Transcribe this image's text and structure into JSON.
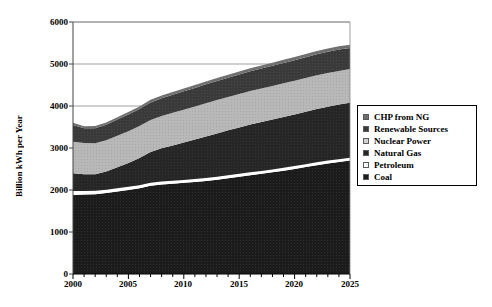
{
  "chart_data": {
    "type": "area",
    "stacked": true,
    "title": "",
    "xlabel": "",
    "ylabel": "Billion kWh per Year",
    "xlim": [
      2000,
      2025
    ],
    "ylim": [
      0,
      6000
    ],
    "ytick_values": [
      0,
      1000,
      2000,
      3000,
      4000,
      5000,
      6000
    ],
    "ytick_labels": [
      "0",
      "1000",
      "2000",
      "3000",
      "4000",
      "5000",
      "6000"
    ],
    "xtick_values": [
      2000,
      2005,
      2010,
      2015,
      2020,
      2025
    ],
    "xtick_labels": [
      "2000",
      "2005",
      "2010",
      "2015",
      "2020",
      "2025"
    ],
    "x_minor_tick_interval": 1,
    "grid": "horizontal",
    "legend_position": "right",
    "x": [
      2000,
      2001,
      2002,
      2003,
      2004,
      2005,
      2006,
      2007,
      2008,
      2009,
      2010,
      2011,
      2012,
      2013,
      2014,
      2015,
      2016,
      2017,
      2018,
      2019,
      2020,
      2021,
      2022,
      2023,
      2024,
      2025
    ],
    "series": [
      {
        "name": "Coal",
        "color": "#1b1b1b",
        "values": [
          1880,
          1890,
          1900,
          1930,
          1965,
          2000,
          2040,
          2100,
          2130,
          2150,
          2170,
          2190,
          2215,
          2245,
          2280,
          2315,
          2350,
          2385,
          2420,
          2460,
          2500,
          2545,
          2590,
          2630,
          2665,
          2700
        ]
      },
      {
        "name": "Petroleum",
        "color": "#ffffff",
        "values": [
          95,
          85,
          80,
          78,
          76,
          75,
          74,
          73,
          72,
          72,
          71,
          71,
          70,
          70,
          70,
          70,
          70,
          70,
          70,
          70,
          70,
          70,
          70,
          70,
          70,
          70
        ]
      },
      {
        "name": "Natural Gas",
        "color": "#262626",
        "values": [
          425,
          400,
          395,
          430,
          500,
          570,
          650,
          730,
          790,
          840,
          890,
          940,
          990,
          1030,
          1070,
          1105,
          1140,
          1165,
          1190,
          1210,
          1230,
          1250,
          1270,
          1285,
          1300,
          1310
        ]
      },
      {
        "name": "Nuclear Power",
        "color": "#b4b4b4",
        "values": [
          750,
          745,
          740,
          745,
          750,
          755,
          760,
          765,
          770,
          775,
          780,
          785,
          790,
          795,
          795,
          795,
          795,
          798,
          798,
          800,
          800,
          800,
          800,
          800,
          800,
          800
        ]
      },
      {
        "name": "Renewable Sources",
        "color": "#3a3a3a",
        "values": [
          400,
          350,
          355,
          370,
          385,
          395,
          405,
          415,
          425,
          430,
          440,
          445,
          450,
          455,
          460,
          465,
          470,
          475,
          480,
          485,
          490,
          495,
          500,
          505,
          510,
          500
        ]
      },
      {
        "name": "CHP from NG",
        "color": "#6e6e6e",
        "values": [
          50,
          50,
          52,
          55,
          58,
          60,
          62,
          63,
          64,
          65,
          66,
          67,
          68,
          69,
          70,
          71,
          72,
          73,
          74,
          75,
          76,
          77,
          78,
          79,
          80,
          80
        ]
      }
    ],
    "cumulative_top": [
      3600,
      3520,
      3522,
      3608,
      3734,
      3855,
      3991,
      4146,
      4251,
      4332,
      4417,
      4498,
      4583,
      4664,
      4745,
      4821,
      4897,
      4966,
      5032,
      5100,
      5166,
      5237,
      5308,
      5369,
      5425,
      5460
    ]
  },
  "legend": {
    "items": [
      {
        "label": "CHP from NG",
        "color": "#6e6e6e"
      },
      {
        "label": "Renewable Sources",
        "color": "#3a3a3a"
      },
      {
        "label": "Nuclear Power",
        "color": "#d2d2d2"
      },
      {
        "label": "Natural Gas",
        "color": "#262626"
      },
      {
        "label": "Petroleum",
        "color": "#ffffff"
      },
      {
        "label": "Coal",
        "color": "#1b1b1b"
      }
    ]
  }
}
